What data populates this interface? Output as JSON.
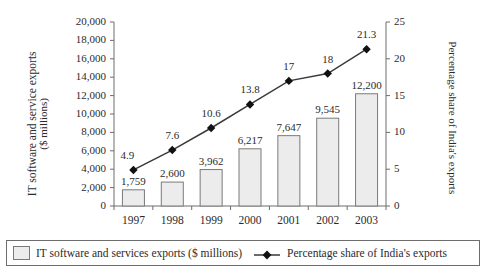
{
  "chart_data": {
    "type": "bar",
    "title": "",
    "subtitle": "",
    "categories": [
      "1997",
      "1998",
      "1999",
      "2000",
      "2001",
      "2002",
      "2003"
    ],
    "xlabel": "",
    "grid": false,
    "legend_position": "bottom",
    "series": [
      {
        "name": "IT software and services exports  ($ millions)",
        "type": "bar",
        "axis": "left",
        "values": [
          1759,
          2600,
          3962,
          6217,
          7647,
          9545,
          12200
        ],
        "value_labels": [
          "1,759",
          "2,600",
          "3,962",
          "6,217",
          "7,647",
          "9,545",
          "12,200"
        ],
        "fill_color": "#ececec",
        "border_color": "#7a7a7a"
      },
      {
        "name": "Percentage share of India's exports",
        "type": "line",
        "axis": "right",
        "values": [
          4.9,
          7.6,
          10.6,
          13.8,
          17,
          18,
          21.3
        ],
        "value_labels": [
          "4.9",
          "7.6",
          "10.6",
          "13.8",
          "17",
          "18",
          "21.3"
        ],
        "line_color": "#3a3a3a",
        "marker": "diamond",
        "marker_color": "#111111"
      }
    ],
    "left_axis": {
      "label_line1": "IT software and service exports",
      "label_line2": "($ millions)",
      "ylim": [
        0,
        20000
      ],
      "ticks": [
        0,
        2000,
        4000,
        6000,
        8000,
        10000,
        12000,
        14000,
        16000,
        18000,
        20000
      ],
      "tick_labels": [
        "0",
        "2,000",
        "4,000",
        "6,000",
        "8,000",
        "10,000",
        "12,000",
        "14,000",
        "16,000",
        "18,000",
        "20,000"
      ]
    },
    "right_axis": {
      "label": "Percentage share of India's exports",
      "ylim": [
        0,
        25
      ],
      "ticks": [
        0,
        5,
        10,
        15,
        20,
        25
      ],
      "tick_labels": [
        "0",
        "5",
        "10",
        "15",
        "20",
        "25"
      ]
    }
  },
  "legend": {
    "bar_entry": "IT software and services exports  ($ millions)",
    "line_entry": "Percentage share of India's exports"
  }
}
